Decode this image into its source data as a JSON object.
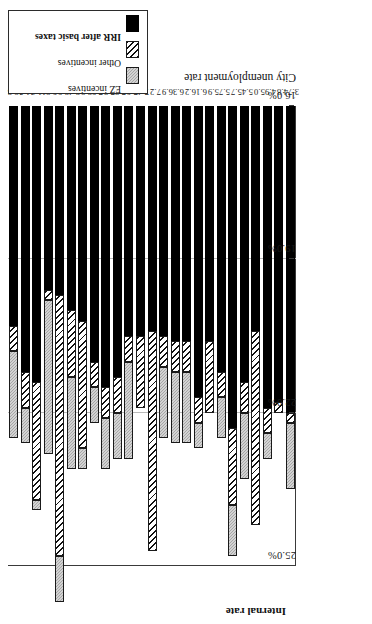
{
  "chart_data": {
    "type": "bar",
    "subtype": "stacked-horizontal",
    "title": "",
    "xlabel": "City unemployment rate",
    "ylabel": "Internal rate",
    "axis_title_y": "Internal rate",
    "axis_title_x": "City unemployment rate",
    "value_axis_ticks": [
      "25.0%",
      "22.0%",
      "19.0%",
      "16.0%"
    ],
    "value_axis_tick_values": [
      25.0,
      22.0,
      19.0,
      16.0
    ],
    "value_axis_reversed": true,
    "value_axis_unit": "%",
    "ylim": [
      16.0,
      25.0
    ],
    "grid": "vertical gridlines at 22.0% and 19.0%",
    "legend_position": "right, outside plot, vertical",
    "categories": [
      "12.8",
      "11.3",
      "11.0",
      "9.2",
      "8.9",
      "8.4",
      "8.2",
      "7.9",
      "7.8",
      "7.8",
      "7.6",
      "7.4",
      "7.2",
      "6.9",
      "6.3",
      "6.2",
      "6.1",
      "5.9",
      "5.7",
      "5.7",
      "5.4",
      "5.0",
      "4.9",
      "4.8",
      "3.7"
    ],
    "series": [
      {
        "name": "IRR after basic taxes",
        "color": "#000000",
        "pattern": "solid-black",
        "values": [
          20.3,
          21.2,
          21.4,
          19.6,
          19.7,
          20.0,
          20.2,
          21.0,
          21.5,
          21.3,
          20.5,
          20.5,
          20.4,
          20.5,
          20.6,
          20.6,
          21.7,
          20.6,
          21.2,
          22.3,
          21.4,
          20.4,
          21.9,
          21.8,
          22.0
        ]
      },
      {
        "name": "Other incentives",
        "color": "#ffffff",
        "pattern": "diagonal-hatch",
        "values": [
          0.5,
          0.7,
          2.3,
          0.2,
          5.1,
          1.3,
          2.5,
          0.5,
          0.6,
          0.7,
          0.5,
          1.4,
          4.3,
          0.6,
          0.6,
          0.6,
          0.5,
          1.4,
          0.5,
          1.5,
          0.6,
          3.8,
          0.5,
          0.2,
          0.2
        ]
      },
      {
        "name": "EZ incentives",
        "color": "#b6b6b6",
        "pattern": "light-gray-stipple",
        "values": [
          1.7,
          0.7,
          0.2,
          3.0,
          0.9,
          1.8,
          0.4,
          0.7,
          1.0,
          0.9,
          1.9,
          0.0,
          0.0,
          1.4,
          1.4,
          1.4,
          0.5,
          0.0,
          0.8,
          1.0,
          1.3,
          0.0,
          0.5,
          0.0,
          1.3
        ]
      }
    ],
    "bars": [
      {
        "category": "12.8",
        "irr": 20.3,
        "other": 0.5,
        "ez": 1.7,
        "total": 22.5
      },
      {
        "category": "11.3",
        "irr": 21.2,
        "other": 0.7,
        "ez": 0.7,
        "total": 22.6
      },
      {
        "category": "11.0",
        "irr": 21.4,
        "other": 2.3,
        "ez": 0.2,
        "total": 23.9
      },
      {
        "category": "9.2",
        "irr": 19.6,
        "other": 0.2,
        "ez": 3.0,
        "total": 22.8
      },
      {
        "category": "8.9",
        "irr": 19.7,
        "other": 5.1,
        "ez": 0.9,
        "total": 25.7
      },
      {
        "category": "8.4",
        "irr": 20.0,
        "other": 1.3,
        "ez": 1.8,
        "total": 23.1
      },
      {
        "category": "8.2",
        "irr": 20.2,
        "other": 2.5,
        "ez": 0.4,
        "total": 23.1
      },
      {
        "category": "7.9",
        "irr": 21.0,
        "other": 0.5,
        "ez": 0.7,
        "total": 22.2
      },
      {
        "category": "7.8",
        "irr": 21.5,
        "other": 0.6,
        "ez": 1.0,
        "total": 23.1
      },
      {
        "category": "7.8",
        "irr": 21.3,
        "other": 0.7,
        "ez": 0.9,
        "total": 22.9
      },
      {
        "category": "7.6",
        "irr": 20.5,
        "other": 0.5,
        "ez": 1.9,
        "total": 22.9
      },
      {
        "category": "7.4",
        "irr": 20.5,
        "other": 1.4,
        "ez": 0.0,
        "total": 21.9
      },
      {
        "category": "7.2",
        "irr": 20.4,
        "other": 4.3,
        "ez": 0.0,
        "total": 24.7
      },
      {
        "category": "6.9",
        "irr": 20.5,
        "other": 0.6,
        "ez": 1.4,
        "total": 22.5
      },
      {
        "category": "6.3",
        "irr": 20.6,
        "other": 0.6,
        "ez": 1.4,
        "total": 22.6
      },
      {
        "category": "6.2",
        "irr": 20.6,
        "other": 0.6,
        "ez": 1.4,
        "total": 22.6
      },
      {
        "category": "6.1",
        "irr": 21.7,
        "other": 0.5,
        "ez": 0.5,
        "total": 22.7
      },
      {
        "category": "5.9",
        "irr": 20.6,
        "other": 1.4,
        "ez": 0.0,
        "total": 22.0
      },
      {
        "category": "5.7",
        "irr": 21.2,
        "other": 0.5,
        "ez": 0.8,
        "total": 22.5
      },
      {
        "category": "5.7",
        "irr": 22.3,
        "other": 1.5,
        "ez": 1.0,
        "total": 24.8
      },
      {
        "category": "5.4",
        "irr": 21.4,
        "other": 0.6,
        "ez": 1.3,
        "total": 23.3
      },
      {
        "category": "5.0",
        "irr": 20.4,
        "other": 3.8,
        "ez": 0.0,
        "total": 24.2
      },
      {
        "category": "4.9",
        "irr": 21.9,
        "other": 0.5,
        "ez": 0.5,
        "total": 22.9
      },
      {
        "category": "4.8",
        "irr": 21.8,
        "other": 0.2,
        "ez": 0.0,
        "total": 22.0
      },
      {
        "category": "3.7",
        "irr": 22.0,
        "other": 0.2,
        "ez": 1.3,
        "total": 23.5
      }
    ]
  },
  "legend": {
    "items": [
      {
        "label": "EZ incentives",
        "swatch": "ez"
      },
      {
        "label": "Other incentives",
        "swatch": "other"
      },
      {
        "label": "IRR after basic taxes",
        "swatch": "irr"
      }
    ]
  }
}
